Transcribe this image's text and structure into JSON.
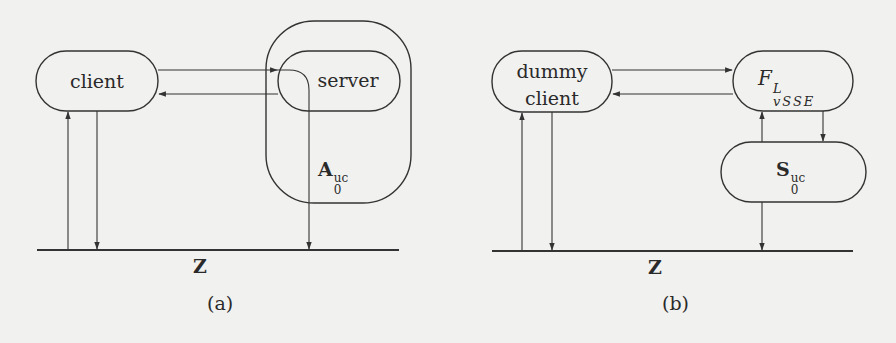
{
  "panels": [
    {
      "id": "a",
      "caption": "(a)",
      "nodes": {
        "client": {
          "label": "client"
        },
        "server": {
          "label": "server"
        },
        "adversary": {
          "base": "A",
          "sub": "0",
          "sup": "uc"
        }
      },
      "environment_label": "Z"
    },
    {
      "id": "b",
      "caption": "(b)",
      "nodes": {
        "dummy_client": {
          "line1": "dummy",
          "line2": "client"
        },
        "functionality": {
          "base": "F",
          "sub": "vSSE",
          "sup": "L"
        },
        "simulator": {
          "base": "S",
          "sub": "0",
          "sup": "uc"
        }
      },
      "environment_label": "Z"
    }
  ],
  "colors": {
    "background": "#f1f1ef",
    "stroke": "#333333"
  }
}
